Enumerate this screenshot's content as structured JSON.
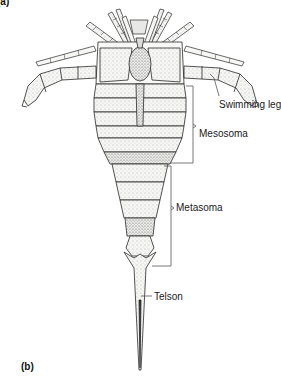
{
  "figure": {
    "panel_top_label": "(a)",
    "panel_bottom_label": "(b)",
    "labels": {
      "swimming_leg": "Swimming leg",
      "mesosoma": "Mesosoma",
      "metasoma": "Metasoma",
      "telson": "Telson"
    },
    "colors": {
      "line": "#2a2a2a",
      "shade": "#8a8a8a",
      "fill": "#f4f4f2",
      "background": "#ffffff"
    }
  }
}
